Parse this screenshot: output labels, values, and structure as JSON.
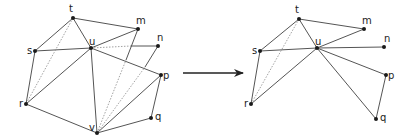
{
  "figure": {
    "arrow": {
      "x1": 183,
      "y1": 73,
      "x2": 243,
      "y2": 73,
      "color": "#222222"
    },
    "left": {
      "nodes": [
        {
          "id": "t",
          "label": "t",
          "x": 73,
          "y": 18,
          "lx": 69,
          "ly": 12
        },
        {
          "id": "m",
          "label": "m",
          "x": 138,
          "y": 29,
          "lx": 136,
          "ly": 24
        },
        {
          "id": "s",
          "label": "s",
          "x": 35,
          "y": 51,
          "lx": 27,
          "ly": 54
        },
        {
          "id": "u",
          "label": "u",
          "x": 91,
          "y": 48,
          "lx": 89,
          "ly": 45
        },
        {
          "id": "n",
          "label": "n",
          "x": 158,
          "y": 46,
          "lx": 157,
          "ly": 41
        },
        {
          "id": "p",
          "label": "p",
          "x": 161,
          "y": 75,
          "lx": 163,
          "ly": 79
        },
        {
          "id": "r",
          "label": "r",
          "x": 26,
          "y": 104,
          "lx": 19,
          "ly": 107
        },
        {
          "id": "q",
          "label": "q",
          "x": 151,
          "y": 118,
          "lx": 155,
          "ly": 120
        },
        {
          "id": "v",
          "label": "v",
          "x": 97,
          "y": 133,
          "lx": 89,
          "ly": 131
        }
      ],
      "edges": [
        {
          "a": "t",
          "b": "m",
          "style": "solid"
        },
        {
          "a": "t",
          "b": "s",
          "style": "solid"
        },
        {
          "a": "t",
          "b": "u",
          "style": "solid"
        },
        {
          "a": "s",
          "b": "u",
          "style": "solid"
        },
        {
          "a": "s",
          "b": "r",
          "style": "solid"
        },
        {
          "a": "u",
          "b": "m",
          "style": "solid"
        },
        {
          "a": "u",
          "b": "r",
          "style": "solid"
        },
        {
          "a": "u",
          "b": "v",
          "style": "solid"
        },
        {
          "a": "u",
          "b": "p",
          "style": "solid"
        },
        {
          "a": "r",
          "b": "v",
          "style": "solid"
        },
        {
          "a": "v",
          "b": "p",
          "style": "solid"
        },
        {
          "a": "v",
          "b": "q",
          "style": "solid"
        },
        {
          "a": "p",
          "b": "q",
          "style": "solid"
        },
        {
          "a": "t",
          "b": "r",
          "style": "dotted"
        }
      ],
      "segments": [
        {
          "x1": 91,
          "y1": 48,
          "x2": 131,
          "y2": 46,
          "style": "dotted"
        },
        {
          "x1": 131,
          "y1": 46,
          "x2": 158,
          "y2": 46,
          "style": "solid"
        },
        {
          "x1": 97,
          "y1": 133,
          "x2": 126,
          "y2": 60,
          "style": "dotted"
        },
        {
          "x1": 126,
          "y1": 60,
          "x2": 138,
          "y2": 29,
          "style": "solid"
        },
        {
          "x1": 97,
          "y1": 133,
          "x2": 145,
          "y2": 67,
          "style": "dotted"
        },
        {
          "x1": 145,
          "y1": 67,
          "x2": 158,
          "y2": 46,
          "style": "solid"
        }
      ]
    },
    "right": {
      "nodes": [
        {
          "id": "t",
          "label": "t",
          "x": 299,
          "y": 19,
          "lx": 295,
          "ly": 13
        },
        {
          "id": "m",
          "label": "m",
          "x": 364,
          "y": 29,
          "lx": 362,
          "ly": 24
        },
        {
          "id": "s",
          "label": "s",
          "x": 260,
          "y": 51,
          "lx": 252,
          "ly": 54
        },
        {
          "id": "u",
          "label": "u",
          "x": 317,
          "y": 48,
          "lx": 315,
          "ly": 45
        },
        {
          "id": "n",
          "label": "n",
          "x": 384,
          "y": 47,
          "lx": 384,
          "ly": 42
        },
        {
          "id": "p",
          "label": "p",
          "x": 386,
          "y": 75,
          "lx": 388,
          "ly": 79
        },
        {
          "id": "r",
          "label": "r",
          "x": 251,
          "y": 104,
          "lx": 244,
          "ly": 107
        },
        {
          "id": "q",
          "label": "q",
          "x": 376,
          "y": 119,
          "lx": 380,
          "ly": 121
        }
      ],
      "edges": [
        {
          "a": "t",
          "b": "m",
          "style": "solid"
        },
        {
          "a": "t",
          "b": "s",
          "style": "solid"
        },
        {
          "a": "t",
          "b": "u",
          "style": "solid"
        },
        {
          "a": "s",
          "b": "u",
          "style": "solid"
        },
        {
          "a": "s",
          "b": "r",
          "style": "solid"
        },
        {
          "a": "u",
          "b": "m",
          "style": "solid"
        },
        {
          "a": "u",
          "b": "n",
          "style": "solid"
        },
        {
          "a": "u",
          "b": "r",
          "style": "solid"
        },
        {
          "a": "u",
          "b": "p",
          "style": "solid"
        },
        {
          "a": "u",
          "b": "q",
          "style": "solid"
        },
        {
          "a": "p",
          "b": "q",
          "style": "solid"
        },
        {
          "a": "t",
          "b": "r",
          "style": "dotted"
        }
      ],
      "segments": []
    }
  }
}
